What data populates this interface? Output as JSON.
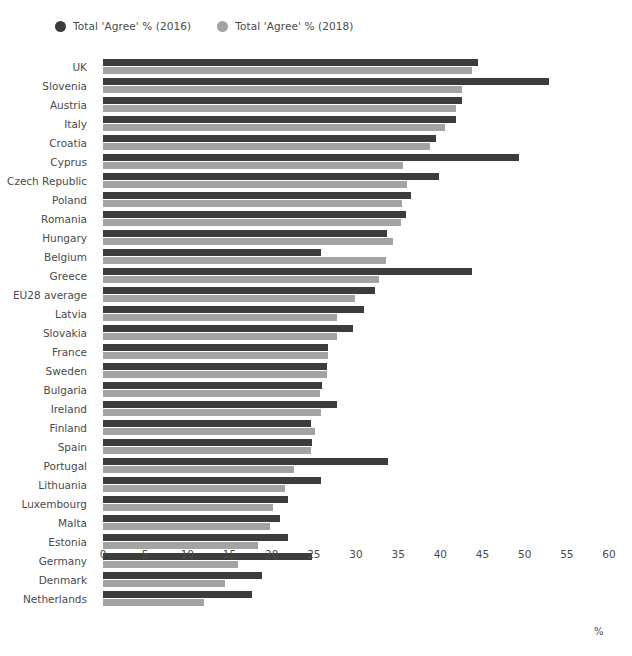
{
  "legend": {
    "position": "top-left",
    "entries": [
      {
        "label": "Total 'Agree' % (2016)",
        "color": "#3c3c3c",
        "marker": "circle-icon"
      },
      {
        "label": "Total 'Agree' % (2018)",
        "color": "#a3a3a3",
        "marker": "circle-icon"
      }
    ]
  },
  "axis": {
    "unit_label": "%",
    "ticks": [
      "0",
      "5",
      "10",
      "15",
      "20",
      "25",
      "30",
      "35",
      "40",
      "45",
      "50",
      "55",
      "60"
    ]
  },
  "chart_data": {
    "type": "bar",
    "orientation": "horizontal",
    "grouped": true,
    "title": "",
    "xlabel": "%",
    "ylabel": "",
    "xlim": [
      0,
      60
    ],
    "xticks": [
      0,
      5,
      10,
      15,
      20,
      25,
      30,
      35,
      40,
      45,
      50,
      55,
      60
    ],
    "grid": false,
    "legend_position": "top-left",
    "categories": [
      "UK",
      "Slovenia",
      "Austria",
      "Italy",
      "Croatia",
      "Cyprus",
      "Czech Republic",
      "Poland",
      "Romania",
      "Hungary",
      "Belgium",
      "Greece",
      "EU28 average",
      "Latvia",
      "Slovakia",
      "France",
      "Sweden",
      "Bulgaria",
      "Ireland",
      "Finland",
      "Spain",
      "Portugal",
      "Lithuania",
      "Luxembourg",
      "Malta",
      "Estonia",
      "Germany",
      "Denmark",
      "Netherlands"
    ],
    "series": [
      {
        "name": "Total 'Agree' % (2016)",
        "color": "#3c3c3c",
        "values": [
          44.5,
          52.9,
          42.6,
          41.8,
          39.5,
          49.3,
          39.8,
          36.5,
          35.9,
          33.7,
          25.8,
          43.8,
          32.3,
          31.0,
          29.7,
          26.7,
          26.6,
          26.0,
          27.8,
          24.7,
          24.8,
          33.8,
          25.8,
          21.9,
          21.0,
          21.9,
          24.8,
          18.9,
          17.7
        ]
      },
      {
        "name": "Total 'Agree' % (2018)",
        "color": "#a3a3a3",
        "values": [
          43.8,
          42.6,
          41.8,
          40.6,
          38.8,
          35.6,
          36.1,
          35.5,
          35.3,
          34.4,
          33.6,
          32.7,
          29.9,
          27.8,
          27.7,
          26.7,
          26.6,
          25.7,
          25.8,
          25.1,
          24.7,
          22.6,
          21.6,
          20.2,
          19.8,
          18.4,
          16.0,
          14.5,
          12.0
        ]
      }
    ]
  }
}
